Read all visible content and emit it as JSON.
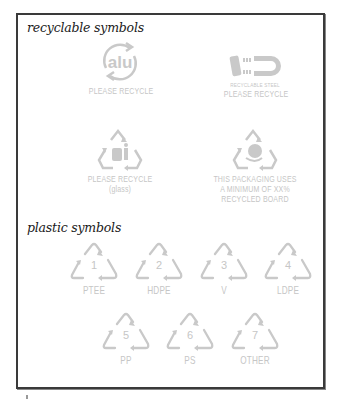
{
  "sections": {
    "recyclable": {
      "title": "recyclable symbols",
      "items": [
        {
          "icon": "aluminium-recycle-icon",
          "glyph": "alu",
          "lines": [
            "PLEASE RECYCLE"
          ]
        },
        {
          "icon": "steel-magnet-icon",
          "small": "RECYCLABLE STEEL",
          "lines": [
            "PLEASE RECYCLE"
          ]
        },
        {
          "icon": "glass-recycle-icon",
          "lines": [
            "PLEASE RECYCLE",
            "(glass)"
          ]
        },
        {
          "icon": "recycled-board-icon",
          "lines": [
            "THIS PACKAGING USES",
            "A MINIMUM OF XX%",
            "RECYCLED BOARD"
          ]
        }
      ]
    },
    "plastic": {
      "title": "plastic symbols",
      "items": [
        {
          "number": "1",
          "label": "PTEE"
        },
        {
          "number": "2",
          "label": "HDPE"
        },
        {
          "number": "3",
          "label": "V"
        },
        {
          "number": "4",
          "label": "LDPE"
        },
        {
          "number": "5",
          "label": "PP"
        },
        {
          "number": "6",
          "label": "PS"
        },
        {
          "number": "7",
          "label": "OTHER"
        }
      ]
    }
  },
  "colors": {
    "frame": "#3a3a3a",
    "symbol": "#c9c9c9",
    "title": "#1a1a1a"
  }
}
